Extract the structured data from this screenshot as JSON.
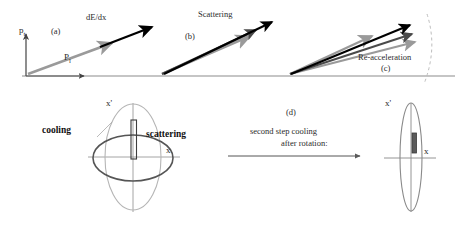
{
  "figure": {
    "background_color": "#ffffff"
  },
  "colors": {
    "axis": "#808080",
    "baseline": "#8c8c8c",
    "arrow_black": "#000000",
    "arrow_gray": "#9a9a9a",
    "arrow_darkgray": "#4a4a4a",
    "ellipse_light": "#b0b0b0",
    "ellipse_dark": "#555555",
    "dashed": "#bdbdbd",
    "text": "#2b2b2b"
  },
  "top_row": {
    "axes": {
      "vertical_label": "p",
      "vertical_subscript": "t",
      "horizontal_label": "P",
      "horizontal_subscript": "l"
    },
    "panels": [
      {
        "id": "a",
        "tag": "(a)",
        "process_label": "dE/dx",
        "arrow_count": 2,
        "description": "single momentum vector shortened by energy loss"
      },
      {
        "id": "b",
        "tag": "(b)",
        "process_label": "Scattering",
        "arrow_count": 3,
        "description": "momentum vectors spread in angle by multiple scattering"
      },
      {
        "id": "c",
        "tag": "(c)",
        "process_label": "Re-acceleration",
        "arrow_count": 4,
        "description": "vectors restored in length along constant momentum arc"
      }
    ]
  },
  "bottom_row": {
    "left_phase_space": {
      "axis_x_label": "x",
      "axis_xprime_label": "x'",
      "annotation_cooling": "cooling",
      "annotation_scattering": "scattering"
    },
    "transition": {
      "tag": "(d)",
      "line1": "second step cooling",
      "line2": "after rotation:"
    },
    "right_phase_space": {
      "axis_x_label": "x",
      "axis_xprime_label": "x'"
    }
  }
}
